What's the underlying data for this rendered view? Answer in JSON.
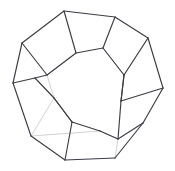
{
  "figure": {
    "shape_name": "dodecahedron",
    "background_color": "#ffffff",
    "visible_edge_color": "#3c3c46",
    "hidden_edge_color": "#d2d2d8",
    "canvas": {
      "width": 175,
      "height": 171
    },
    "counts": {
      "faces": 12,
      "edges": 30,
      "vertices": 20
    }
  },
  "geometry": {
    "vertices": {
      "v0": [
        64,
        11
      ],
      "v1": [
        115,
        17
      ],
      "v2": [
        148,
        38
      ],
      "v3": [
        163,
        88
      ],
      "v4": [
        143,
        123
      ],
      "v5": [
        115,
        158
      ],
      "v6": [
        65,
        160
      ],
      "v7": [
        31,
        136
      ],
      "v8": [
        13,
        83
      ],
      "v9": [
        22,
        43
      ],
      "v10": [
        47,
        75
      ],
      "v11": [
        103,
        48
      ],
      "v12": [
        54,
        98
      ],
      "v13": [
        121,
        101
      ],
      "v14": [
        35,
        78
      ],
      "v15": [
        72,
        122
      ],
      "v16": [
        124,
        75
      ],
      "v17": [
        76,
        53
      ],
      "v18": [
        118,
        139
      ],
      "v19": [
        100,
        131
      ]
    },
    "visible_edges": [
      [
        "v0",
        "v1"
      ],
      [
        "v1",
        "v2"
      ],
      [
        "v2",
        "v3"
      ],
      [
        "v3",
        "v4"
      ],
      [
        "v4",
        "v5"
      ],
      [
        "v5",
        "v6"
      ],
      [
        "v6",
        "v7"
      ],
      [
        "v7",
        "v8"
      ],
      [
        "v8",
        "v9"
      ],
      [
        "v9",
        "v0"
      ],
      [
        "v0",
        "v17"
      ],
      [
        "v17",
        "v11"
      ],
      [
        "v11",
        "v1"
      ],
      [
        "v11",
        "v16"
      ],
      [
        "v16",
        "v2"
      ],
      [
        "v16",
        "v13"
      ],
      [
        "v13",
        "v3"
      ],
      [
        "v13",
        "v18"
      ],
      [
        "v18",
        "v4"
      ],
      [
        "v18",
        "v19"
      ],
      [
        "v19",
        "v15"
      ],
      [
        "v15",
        "v6"
      ],
      [
        "v15",
        "v12"
      ],
      [
        "v12",
        "v14"
      ],
      [
        "v14",
        "v8"
      ],
      [
        "v14",
        "v10"
      ],
      [
        "v10",
        "v9"
      ],
      [
        "v17",
        "v10"
      ],
      [
        "v12",
        "v15"
      ],
      [
        "v13",
        "v16"
      ]
    ],
    "hidden_edges": [
      [
        "v10",
        "v12"
      ],
      [
        "v11",
        "v16"
      ],
      [
        "v17",
        "v10"
      ],
      [
        "v7",
        "v19"
      ],
      [
        "v19",
        "v18"
      ],
      [
        "v5",
        "v18"
      ],
      [
        "v2",
        "v16"
      ],
      [
        "v12",
        "v7"
      ]
    ],
    "front_face": [
      "v17",
      "v11",
      "v16",
      "v13",
      "v15",
      "v12",
      "v10"
    ]
  }
}
